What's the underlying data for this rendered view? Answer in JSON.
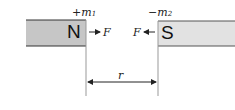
{
  "diagram": {
    "north_magnet": {
      "pole_label": "N",
      "charge_sign": "+",
      "charge_symbol": "m",
      "charge_subscript": "1",
      "fill": "#c6c6c6"
    },
    "south_magnet": {
      "pole_label": "S",
      "charge_sign": "−",
      "charge_symbol": "m",
      "charge_subscript": "2",
      "fill": "#e2e2e2"
    },
    "force_right": {
      "label": "F",
      "direction": "right"
    },
    "force_left": {
      "label": "F",
      "direction": "left"
    },
    "distance": {
      "label": "r"
    },
    "colors": {
      "stroke": "#333333",
      "guide_line": "#999999"
    }
  }
}
